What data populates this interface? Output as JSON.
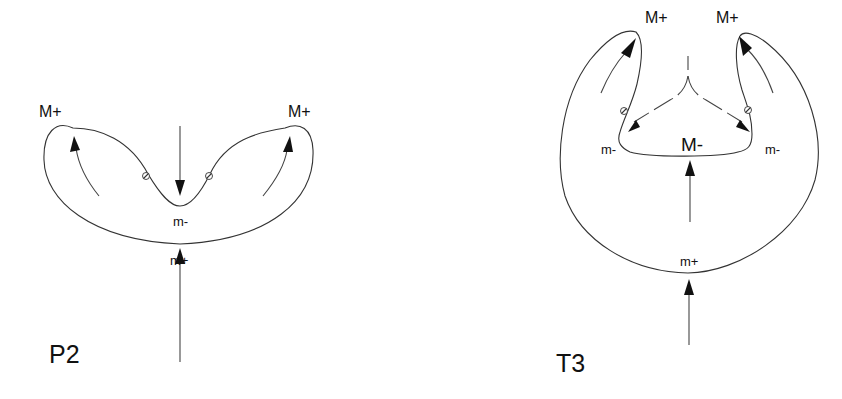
{
  "figure": {
    "type": "topological critical-point diagram",
    "panels": [
      {
        "id": "P2",
        "label": "P2",
        "labels": {
          "max_left": "M+",
          "max_right": "M+",
          "min_saddle": "m-",
          "min_bottom": "m+"
        },
        "critical_point_marker": "crossed-circle",
        "critical_point_count": 2,
        "arrows": [
          {
            "direction": "down",
            "description": "arrow pointing down into the notch at m-"
          },
          {
            "direction": "up",
            "description": "arrow pointing up toward m+ from below"
          },
          {
            "direction": "up-left",
            "description": "curved arrow toward left M+"
          },
          {
            "direction": "up-right",
            "description": "curved arrow toward right M+"
          }
        ]
      },
      {
        "id": "T3",
        "label": "T3",
        "labels": {
          "max_left": "M+",
          "max_right": "M+",
          "saddle_left": "m-",
          "saddle_right": "m-",
          "inner_max": "M-",
          "min_bottom": "m+"
        },
        "critical_point_marker": "crossed-circle",
        "critical_point_count": 2,
        "arrows": [
          {
            "direction": "up",
            "description": "arrow from below pointing up at m+"
          },
          {
            "direction": "up",
            "description": "arrow inside pointing up at M-"
          },
          {
            "direction": "down-left",
            "description": "dashed arrow toward left m-"
          },
          {
            "direction": "down-right",
            "description": "dashed arrow toward right m-"
          },
          {
            "direction": "up-left",
            "description": "curved arrow toward left M+"
          },
          {
            "direction": "up-right",
            "description": "curved arrow toward right M+"
          }
        ]
      }
    ],
    "colors": {
      "background": "#ffffff",
      "line": "#333333",
      "arrowhead": "#111111",
      "text": "#111111"
    }
  }
}
